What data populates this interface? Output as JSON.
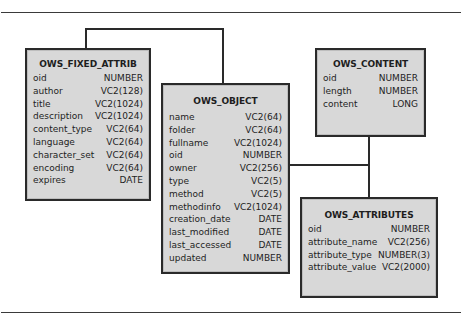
{
  "diagram": {
    "entities": {
      "fixed_attrib": {
        "name": "OWS_FIXED_ATTRIB",
        "columns": [
          {
            "name": "oid",
            "type": "NUMBER"
          },
          {
            "name": "author",
            "type": "VC2(128)"
          },
          {
            "name": "title",
            "type": "VC2(1024)"
          },
          {
            "name": "description",
            "type": "VC2(1024)"
          },
          {
            "name": "content_type",
            "type": "VC2(64)"
          },
          {
            "name": "language",
            "type": "VC2(64)"
          },
          {
            "name": "character_set",
            "type": "VC2(64)"
          },
          {
            "name": "encoding",
            "type": "VC2(64)"
          },
          {
            "name": "expires",
            "type": "DATE"
          }
        ]
      },
      "object": {
        "name": "OWS_OBJECT",
        "columns": [
          {
            "name": "name",
            "type": "VC2(64)"
          },
          {
            "name": "folder",
            "type": "VC2(64)"
          },
          {
            "name": "fullname",
            "type": "VC2(1024)"
          },
          {
            "name": "oid",
            "type": "NUMBER"
          },
          {
            "name": "owner",
            "type": "VC2(256)"
          },
          {
            "name": "type",
            "type": "VC2(5)"
          },
          {
            "name": "method",
            "type": "VC2(5)"
          },
          {
            "name": "methodinfo",
            "type": "VC2(1024)"
          },
          {
            "name": "creation_date",
            "type": "DATE"
          },
          {
            "name": "last_modified",
            "type": "DATE"
          },
          {
            "name": "last_accessed",
            "type": "DATE"
          },
          {
            "name": "updated",
            "type": "NUMBER"
          }
        ]
      },
      "content": {
        "name": "OWS_CONTENT",
        "columns": [
          {
            "name": "oid",
            "type": "NUMBER"
          },
          {
            "name": "length",
            "type": "NUMBER"
          },
          {
            "name": "content",
            "type": "LONG"
          }
        ]
      },
      "attributes": {
        "name": "OWS_ATTRIBUTES",
        "columns": [
          {
            "name": "oid",
            "type": "NUMBER"
          },
          {
            "name": "attribute_name",
            "type": "VC2(256)"
          },
          {
            "name": "attribute_type",
            "type": "NUMBER(3)"
          },
          {
            "name": "attribute_value",
            "type": "VC2(2000)"
          }
        ]
      }
    },
    "relationships": [
      {
        "from": "OWS_FIXED_ATTRIB",
        "to": "OWS_OBJECT"
      },
      {
        "from": "OWS_OBJECT",
        "to": "OWS_CONTENT"
      },
      {
        "from": "OWS_OBJECT",
        "to": "OWS_ATTRIBUTES"
      },
      {
        "from": "OWS_CONTENT",
        "to": "OWS_ATTRIBUTES"
      }
    ],
    "colors": {
      "box_fill": "#d8d8d8",
      "border": "#2a2a2a",
      "text": "#1e1e1e"
    }
  }
}
